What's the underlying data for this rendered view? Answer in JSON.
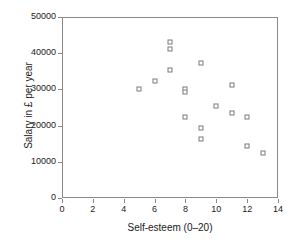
{
  "chart_data": {
    "type": "scatter",
    "title": "",
    "xlabel": "Self-esteem (0–20)",
    "ylabel": "Salary in £ per year",
    "xlim": [
      0,
      14
    ],
    "ylim": [
      0,
      50000
    ],
    "xticks": [
      0,
      2,
      4,
      6,
      8,
      10,
      12,
      14
    ],
    "xtick_labels": [
      "0",
      "2",
      "4",
      "6",
      "8",
      "10",
      "12",
      "14"
    ],
    "yticks": [
      0,
      10000,
      20000,
      30000,
      40000,
      50000
    ],
    "ytick_labels": [
      "0",
      "10000",
      "20000",
      "30000",
      "40000",
      "50000"
    ],
    "grid": false,
    "legend": null,
    "marker": "open-square",
    "marker_color": "#7a7a7a",
    "series": [
      {
        "name": "respondents",
        "points": [
          {
            "x": 5,
            "y": 30200
          },
          {
            "x": 6,
            "y": 32200
          },
          {
            "x": 7,
            "y": 43200
          },
          {
            "x": 7,
            "y": 41200
          },
          {
            "x": 7,
            "y": 35300
          },
          {
            "x": 8,
            "y": 30000
          },
          {
            "x": 8,
            "y": 29400
          },
          {
            "x": 8,
            "y": 22300
          },
          {
            "x": 9,
            "y": 37400
          },
          {
            "x": 9,
            "y": 19300
          },
          {
            "x": 9,
            "y": 16300
          },
          {
            "x": 10,
            "y": 25300
          },
          {
            "x": 11,
            "y": 31300
          },
          {
            "x": 11,
            "y": 23400
          },
          {
            "x": 12,
            "y": 22400
          },
          {
            "x": 12,
            "y": 14300
          },
          {
            "x": 13,
            "y": 12400
          }
        ]
      }
    ]
  }
}
